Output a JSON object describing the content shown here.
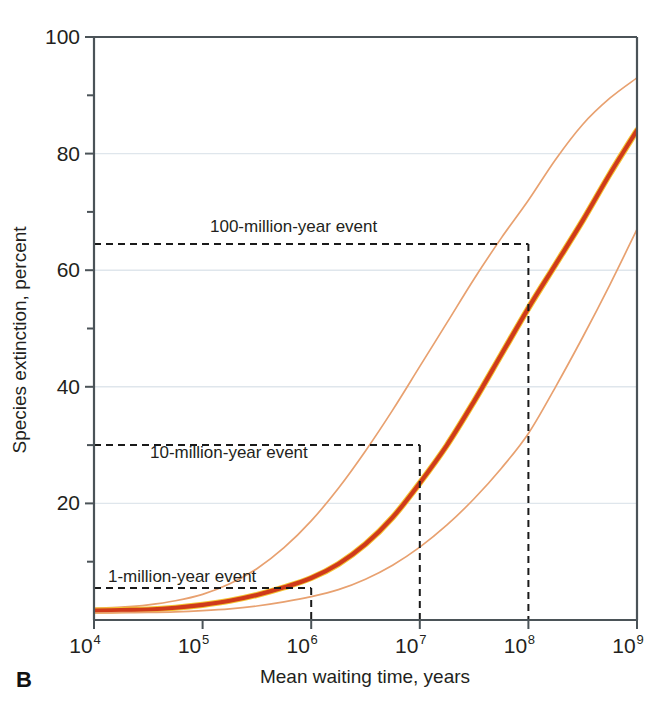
{
  "panel": {
    "label": "B"
  },
  "colors": {
    "main_curve": "#cf3a1b",
    "main_curve_highlight": "#f4c433",
    "band_curve": "#e8a170",
    "axis": "#4b5358",
    "gridline": "#dfe6ec",
    "annotation_dash": "#1a1a1a",
    "text": "#231f20",
    "background": "#ffffff"
  },
  "chart_data": {
    "type": "line",
    "title": "",
    "xlabel": "Mean waiting time, years",
    "ylabel": "Species extinction, percent",
    "xscale": "log",
    "xlim": [
      10000,
      1000000000
    ],
    "ylim": [
      0,
      100
    ],
    "grid": "horizontal",
    "legend_position": "none",
    "x_ticks": [
      {
        "value": 10000,
        "mantissa": "10",
        "exponent": "4",
        "label": "10^4"
      },
      {
        "value": 100000,
        "mantissa": "10",
        "exponent": "5",
        "label": "10^5"
      },
      {
        "value": 1000000,
        "mantissa": "10",
        "exponent": "6",
        "label": "10^6"
      },
      {
        "value": 10000000,
        "mantissa": "10",
        "exponent": "7",
        "label": "10^7"
      },
      {
        "value": 100000000,
        "mantissa": "10",
        "exponent": "8",
        "label": "10^8"
      },
      {
        "value": 1000000000,
        "mantissa": "10",
        "exponent": "9",
        "label": "10^9"
      }
    ],
    "y_ticks_major": [
      {
        "value": 20,
        "label": "20"
      },
      {
        "value": 40,
        "label": "40"
      },
      {
        "value": 60,
        "label": "60"
      },
      {
        "value": 80,
        "label": "80"
      },
      {
        "value": 100,
        "label": "100"
      }
    ],
    "y_ticks_minor": [
      10,
      30,
      50,
      70,
      90
    ],
    "gridlines_y": [
      20,
      40,
      60,
      80
    ],
    "x": [
      10000,
      17800,
      31600,
      56200,
      100000,
      178000,
      316000,
      562000,
      1000000,
      1780000,
      3160000,
      5620000,
      10000000,
      17800000,
      31600000,
      56200000,
      100000000,
      178000000,
      316000000,
      562000000,
      1000000000
    ],
    "series": [
      {
        "name": "upper-confidence-band",
        "style": "thin",
        "values": [
          2.0,
          2.2,
          2.6,
          3.3,
          4.4,
          6.2,
          8.8,
          12.4,
          17.0,
          22.6,
          29.0,
          36.0,
          43.5,
          51.0,
          58.5,
          65.5,
          72.0,
          79.0,
          85.0,
          89.5,
          93.0
        ]
      },
      {
        "name": "median-extinction-curve",
        "style": "thick",
        "values": [
          1.6,
          1.7,
          1.8,
          2.1,
          2.6,
          3.3,
          4.3,
          5.6,
          7.2,
          9.6,
          13.0,
          17.6,
          23.5,
          30.0,
          37.5,
          45.5,
          53.5,
          61.0,
          68.5,
          76.5,
          84.0
        ]
      },
      {
        "name": "lower-confidence-band",
        "style": "thin",
        "values": [
          1.2,
          1.25,
          1.3,
          1.4,
          1.6,
          1.9,
          2.4,
          3.1,
          4.0,
          5.2,
          7.0,
          9.4,
          12.5,
          16.3,
          20.8,
          26.0,
          32.0,
          40.0,
          48.5,
          57.5,
          67.0
        ]
      }
    ],
    "annotations": [
      {
        "name": "1-million-year-event",
        "label": "1-million-year event",
        "x": 1000000,
        "y": 5.5,
        "text_x_px": 108,
        "text_y_px": 582
      },
      {
        "name": "10-million-year-event",
        "label": "10-million-year event",
        "x": 10000000,
        "y": 30.0,
        "text_x_px": 150,
        "text_y_px": 458
      },
      {
        "name": "100-million-year-event",
        "label": "100-million-year event",
        "x": 100000000,
        "y": 64.5,
        "text_x_px": 210,
        "text_y_px": 232
      }
    ]
  }
}
